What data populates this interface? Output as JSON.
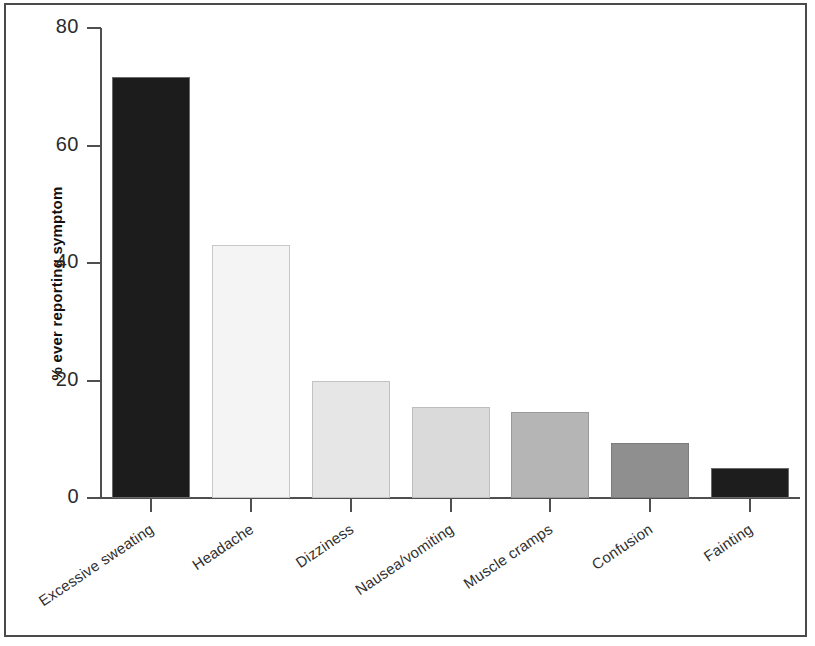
{
  "chart_data": {
    "type": "bar",
    "title": "",
    "subtitle": "",
    "xlabel": "",
    "ylabel": "% ever reporting symptom",
    "ylim": [
      0,
      80
    ],
    "yticks": [
      0,
      20,
      40,
      60,
      80
    ],
    "ytick_labels": [
      "0",
      "20",
      "40",
      "60",
      "80"
    ],
    "grid": false,
    "legend": null,
    "categories": [
      "Excessive sweating",
      "Headache",
      "Dizziness",
      "Nausea/vomiting",
      "Muscle cramps",
      "Confusion",
      "Fainting"
    ],
    "values": [
      71.7,
      43.0,
      20.0,
      15.5,
      14.6,
      9.4,
      5.1
    ],
    "bar_colors": [
      "#1c1c1c",
      "#f4f4f4",
      "#e6e6e6",
      "#dadada",
      "#b5b5b5",
      "#8f8f8f",
      "#1d1d1d"
    ],
    "bar_edge_colors": [
      "#6a6a6a",
      "#c8c8c8",
      "#c2c2c2",
      "#bdbdbd",
      "#9a9a9a",
      "#7c7c7c",
      "#6a6a6a"
    ],
    "axis_color": "#4f4f4f",
    "text_color": "#2b2b2b",
    "background": "#ffffff",
    "frame_color": "#4a4a4a"
  }
}
